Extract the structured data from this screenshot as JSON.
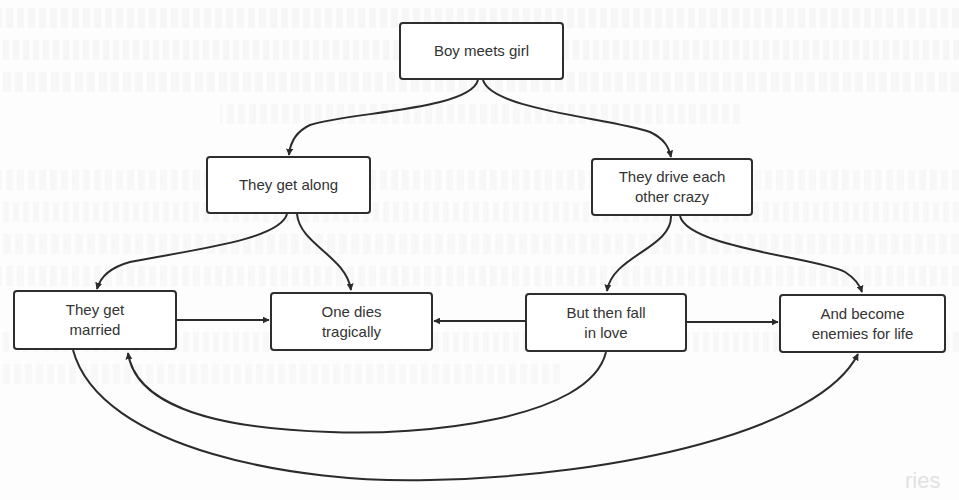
{
  "diagram": {
    "type": "flowchart",
    "title": "",
    "nodes": [
      {
        "id": "boy-meets-girl",
        "label": "Boy meets girl",
        "x": 399,
        "y": 22,
        "w": 165,
        "h": 58
      },
      {
        "id": "they-get-along",
        "label": "They get along",
        "x": 206,
        "y": 156,
        "w": 165,
        "h": 58
      },
      {
        "id": "they-drive-each-other-crazy",
        "label_line1": "They drive each",
        "label_line2": "other crazy",
        "x": 591,
        "y": 158,
        "w": 162,
        "h": 58
      },
      {
        "id": "they-get-married",
        "label_line1": "They get",
        "label_line2": "married",
        "x": 13,
        "y": 290,
        "w": 164,
        "h": 60
      },
      {
        "id": "one-dies-tragically",
        "label_line1": "One dies",
        "label_line2": "tragically",
        "x": 270,
        "y": 292,
        "w": 163,
        "h": 59
      },
      {
        "id": "but-then-fall-in-love",
        "label_line1": "But then fall",
        "label_line2": "in love",
        "x": 525,
        "y": 293,
        "w": 162,
        "h": 59
      },
      {
        "id": "and-become-enemies-for-life",
        "label_line1": "And become",
        "label_line2": "enemies for life",
        "x": 779,
        "y": 294,
        "w": 167,
        "h": 59
      }
    ],
    "edges": [
      {
        "from": "boy-meets-girl",
        "to": "they-get-along"
      },
      {
        "from": "boy-meets-girl",
        "to": "they-drive-each-other-crazy"
      },
      {
        "from": "they-get-along",
        "to": "they-get-married"
      },
      {
        "from": "they-get-along",
        "to": "one-dies-tragically"
      },
      {
        "from": "they-drive-each-other-crazy",
        "to": "but-then-fall-in-love"
      },
      {
        "from": "they-drive-each-other-crazy",
        "to": "and-become-enemies-for-life"
      },
      {
        "from": "they-get-married",
        "to": "one-dies-tragically"
      },
      {
        "from": "but-then-fall-in-love",
        "to": "one-dies-tragically"
      },
      {
        "from": "but-then-fall-in-love",
        "to": "and-become-enemies-for-life"
      },
      {
        "from": "but-then-fall-in-love",
        "to": "they-get-married"
      },
      {
        "from": "they-get-married",
        "to": "and-become-enemies-for-life"
      }
    ],
    "colors": {
      "stroke": "#2b2b2b",
      "node_fill": "#ffffff",
      "text": "#333333",
      "background": "#fdfdfd"
    }
  },
  "background_bleed": {
    "footer_fragment": "ries"
  }
}
